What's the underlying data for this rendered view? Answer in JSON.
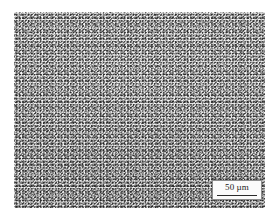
{
  "figure": {
    "kind": "optical-micrograph",
    "plate": {
      "x": 14,
      "y": 12,
      "width": 251,
      "height": 196,
      "background_color": "#cfcfcf",
      "grain_dark_color": "#2e2e2e",
      "grain_light_color": "#fbfbfb"
    },
    "page_background": "#ffffff"
  },
  "scale_bar": {
    "value": "50",
    "unit": "µm",
    "label": "50 µm",
    "box_background": "#fbfbfb",
    "box_border_color": "#8d8d8d",
    "rule_color": "#2a2a2a",
    "text_color": "#1b1b1b",
    "position": "bottom-right"
  }
}
